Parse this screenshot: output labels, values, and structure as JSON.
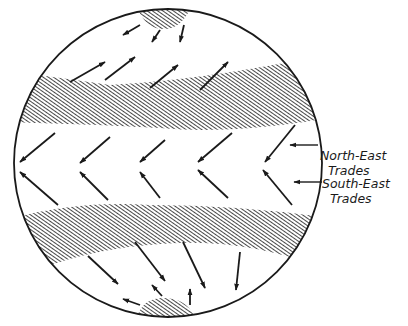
{
  "diagram": {
    "colors": {
      "ink": "#1a1a1a",
      "background": "#ffffff"
    },
    "labels": [
      {
        "id": "ne",
        "line1": "North-East",
        "line2": "Trades"
      },
      {
        "id": "se",
        "line1": "South-East",
        "line2": "Trades"
      }
    ],
    "regions": [
      {
        "name": "north-polar-cap",
        "pattern": "hatched"
      },
      {
        "name": "northern-high-pressure-belt",
        "pattern": "hatched"
      },
      {
        "name": "southern-high-pressure-belt",
        "pattern": "hatched"
      },
      {
        "name": "south-polar-cap",
        "pattern": "hatched"
      }
    ],
    "wind_groups": [
      {
        "name": "polar-easterlies-north",
        "direction": "south-west"
      },
      {
        "name": "westerlies-north",
        "direction": "north-east"
      },
      {
        "name": "north-east-trades",
        "direction": "south-west"
      },
      {
        "name": "south-east-trades",
        "direction": "north-west"
      },
      {
        "name": "westerlies-south",
        "direction": "south-east"
      },
      {
        "name": "polar-easterlies-south",
        "direction": "north-west"
      }
    ]
  }
}
